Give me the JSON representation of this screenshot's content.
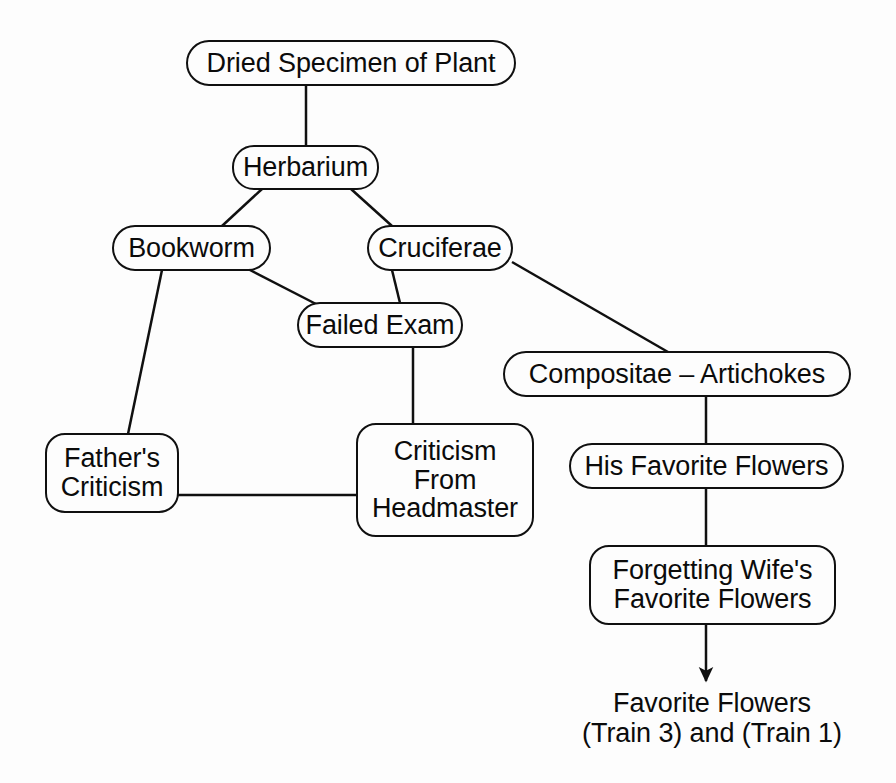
{
  "diagram": {
    "type": "mind-map",
    "background_color": "#fdfdfd",
    "stroke_color": "#101010",
    "text_color": "#0b0b0b",
    "nodes": [
      {
        "id": "dried-specimen",
        "label": "Dried Specimen of Plant",
        "shape": "rounded-rect",
        "x": 186,
        "y": 40,
        "w": 330,
        "h": 46,
        "font_size": 27,
        "radius": 23
      },
      {
        "id": "herbarium",
        "label": "Herbarium",
        "shape": "rounded-rect",
        "x": 232,
        "y": 145,
        "w": 147,
        "h": 45,
        "font_size": 27,
        "radius": 22
      },
      {
        "id": "bookworm",
        "label": "Bookworm",
        "shape": "rounded-rect",
        "x": 112,
        "y": 225,
        "w": 159,
        "h": 46,
        "font_size": 27,
        "radius": 23
      },
      {
        "id": "cruciferae",
        "label": "Cruciferae",
        "shape": "rounded-rect",
        "x": 367,
        "y": 225,
        "w": 146,
        "h": 46,
        "font_size": 27,
        "radius": 23
      },
      {
        "id": "failed-exam",
        "label": "Failed Exam",
        "shape": "rounded-rect",
        "x": 297,
        "y": 302,
        "w": 166,
        "h": 46,
        "font_size": 27,
        "radius": 23
      },
      {
        "id": "compositae-artichokes",
        "label": "Compositae – Artichokes",
        "shape": "rounded-rect",
        "x": 503,
        "y": 351,
        "w": 348,
        "h": 46,
        "font_size": 27,
        "radius": 23
      },
      {
        "id": "fathers-criticism",
        "label": "Father's\nCriticism",
        "shape": "rounded-rect",
        "x": 45,
        "y": 433,
        "w": 134,
        "h": 80,
        "font_size": 27,
        "radius": 20
      },
      {
        "id": "criticism-from-headmaster",
        "label": "Criticism\nFrom\nHeadmaster",
        "shape": "rounded-rect",
        "x": 356,
        "y": 423,
        "w": 178,
        "h": 114,
        "font_size": 27,
        "radius": 20
      },
      {
        "id": "his-favorite-flowers",
        "label": "His Favorite Flowers",
        "shape": "rounded-rect",
        "x": 569,
        "y": 443,
        "w": 275,
        "h": 46,
        "font_size": 27,
        "radius": 23
      },
      {
        "id": "forgetting-wifes-favorite-flowers",
        "label": "Forgetting Wife's\nFavorite Flowers",
        "shape": "rounded-rect",
        "x": 589,
        "y": 545,
        "w": 247,
        "h": 80,
        "font_size": 27,
        "radius": 20
      }
    ],
    "leaf_labels": [
      {
        "id": "favorite-flowers-trains",
        "label": "Favorite Flowers\n(Train 3) and (Train 1)",
        "x": 562,
        "y": 685,
        "w": 300,
        "h": 66,
        "font_size": 27
      }
    ],
    "edges": [
      {
        "id": "dried-specimen-to-herbarium",
        "from": "dried-specimen",
        "to": "herbarium",
        "x1": 306,
        "y1": 86,
        "x2": 306,
        "y2": 145,
        "arrow": false
      },
      {
        "id": "herbarium-to-bookworm",
        "from": "herbarium",
        "to": "bookworm",
        "x1": 262,
        "y1": 189,
        "x2": 222,
        "y2": 226,
        "arrow": false
      },
      {
        "id": "herbarium-to-cruciferae",
        "from": "herbarium",
        "to": "cruciferae",
        "x1": 351,
        "y1": 189,
        "x2": 392,
        "y2": 226,
        "arrow": false
      },
      {
        "id": "bookworm-to-failed-exam",
        "from": "bookworm",
        "to": "failed-exam",
        "x1": 248,
        "y1": 269,
        "x2": 316,
        "y2": 304,
        "arrow": false
      },
      {
        "id": "cruciferae-to-failed-exam",
        "from": "cruciferae",
        "to": "failed-exam",
        "x1": 392,
        "y1": 270,
        "x2": 400,
        "y2": 303,
        "arrow": false
      },
      {
        "id": "cruciferae-to-compositae",
        "from": "cruciferae",
        "to": "compositae-artichokes",
        "x1": 512,
        "y1": 262,
        "x2": 668,
        "y2": 352,
        "arrow": false
      },
      {
        "id": "bookworm-to-fathers-criticism",
        "from": "bookworm",
        "to": "fathers-criticism",
        "x1": 162,
        "y1": 270,
        "x2": 128,
        "y2": 434,
        "arrow": false
      },
      {
        "id": "failed-exam-to-criticism-headmaster",
        "from": "failed-exam",
        "to": "criticism-from-headmaster",
        "x1": 413,
        "y1": 348,
        "x2": 413,
        "y2": 424,
        "arrow": false
      },
      {
        "id": "fathers-criticism-to-criticism-headmaster",
        "from": "fathers-criticism",
        "to": "criticism-from-headmaster",
        "x1": 178,
        "y1": 495,
        "x2": 357,
        "y2": 495,
        "arrow": false
      },
      {
        "id": "compositae-to-his-favorite-flowers",
        "from": "compositae-artichokes",
        "to": "his-favorite-flowers",
        "x1": 706,
        "y1": 397,
        "x2": 706,
        "y2": 444,
        "arrow": false
      },
      {
        "id": "his-favorite-to-forgetting-wifes",
        "from": "his-favorite-flowers",
        "to": "forgetting-wifes-favorite-flowers",
        "x1": 706,
        "y1": 489,
        "x2": 706,
        "y2": 546,
        "arrow": false
      },
      {
        "id": "forgetting-wifes-to-favorite-flowers-trains",
        "from": "forgetting-wifes-favorite-flowers",
        "to": "favorite-flowers-trains",
        "x1": 706,
        "y1": 625,
        "x2": 706,
        "y2": 681,
        "arrow": true
      }
    ]
  }
}
